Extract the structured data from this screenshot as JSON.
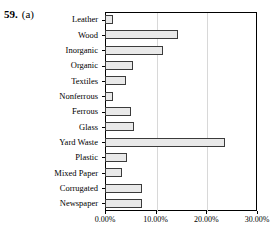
{
  "figure": {
    "number": "59.",
    "part": "(a)"
  },
  "chart_data": {
    "type": "bar",
    "orientation": "horizontal",
    "title": "",
    "xlabel": "",
    "ylabel": "",
    "xlim": [
      0,
      30
    ],
    "xticks": [
      0,
      10,
      20,
      30
    ],
    "xticklabels": [
      "0.00%",
      "10.00%",
      "20.00%",
      "30.00%"
    ],
    "grid": false,
    "legend": null,
    "bar_fill_color": "#e9e9e9",
    "bar_edge_color": "#3b3b3b",
    "axis_color": "#000000",
    "categories": [
      "Leather",
      "Wood",
      "Inorganic",
      "Organic",
      "Textiles",
      "Nonferrous",
      "Ferrous",
      "Glass",
      "Yard Waste",
      "Plastic",
      "Mixed Paper",
      "Corrugated",
      "Newspaper"
    ],
    "values": [
      1.6,
      14.4,
      11.4,
      5.5,
      4.1,
      1.6,
      5.1,
      5.7,
      23.7,
      4.3,
      3.3,
      7.3,
      7.3
    ],
    "value_labels": [
      "1.60%",
      "14.40%",
      "11.40%",
      "5.50%",
      "4.10%",
      "1.60%",
      "5.10%",
      "5.70%",
      "23.70%",
      "4.30%",
      "3.30%",
      "7.30%",
      "7.30%"
    ]
  }
}
